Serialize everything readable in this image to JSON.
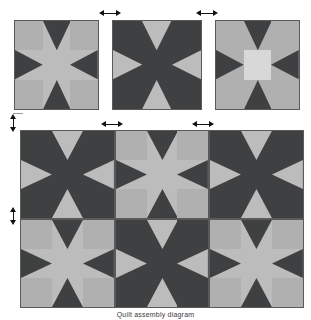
{
  "figure": {
    "caption": "Quilt assembly diagram",
    "background": "#ffffff"
  },
  "palette": {
    "dark": "#3f4042",
    "medium": "#b0b0b0",
    "light": "#bcbcbc",
    "pale": "#d8d8d8",
    "outline": "#5a5a5a",
    "arrow": "#111111"
  },
  "block_variants": {
    "light_star": {
      "name": "light-dominant-sawtooth-star",
      "corner": "medium",
      "center": "light",
      "point": "dark",
      "field": "light"
    },
    "dark_star": {
      "name": "dark-dominant-sawtooth-star",
      "corner": "dark",
      "center": "dark",
      "point": "light",
      "field": "dark"
    },
    "pale_star": {
      "name": "pale-center-sawtooth-star",
      "corner": "medium",
      "center": "pale",
      "point": "dark",
      "field": "medium"
    }
  },
  "top_row": {
    "label": "individual blocks",
    "blocks": [
      {
        "index": 1,
        "variant": "light_star"
      },
      {
        "index": 2,
        "variant": "dark_star"
      },
      {
        "index": 3,
        "variant": "pale_star"
      }
    ]
  },
  "assembly_grid": {
    "label": "assembled quilt top",
    "columns": 3,
    "rows": 2,
    "blocks": [
      {
        "row": 1,
        "col": 1,
        "variant": "dark_star"
      },
      {
        "row": 1,
        "col": 2,
        "variant": "light_star"
      },
      {
        "row": 1,
        "col": 3,
        "variant": "dark_star"
      },
      {
        "row": 2,
        "col": 1,
        "variant": "light_star"
      },
      {
        "row": 2,
        "col": 2,
        "variant": "dark_star"
      },
      {
        "row": 2,
        "col": 3,
        "variant": "light_star"
      }
    ]
  },
  "dimension_arrows": {
    "horizontal": [
      {
        "id": "top-sash-1",
        "note": "sashing between block 1 and 2"
      },
      {
        "id": "top-sash-2",
        "note": "sashing between block 2 and 3"
      },
      {
        "id": "grid-sash-1",
        "note": "sashing between column 1 and 2"
      },
      {
        "id": "grid-sash-2",
        "note": "sashing between column 2 and 3"
      }
    ],
    "vertical": [
      {
        "id": "row-sash-1",
        "note": "sashing between top row and grid"
      },
      {
        "id": "row-sash-2",
        "note": "sashing between grid row 1 and row 2"
      }
    ]
  }
}
